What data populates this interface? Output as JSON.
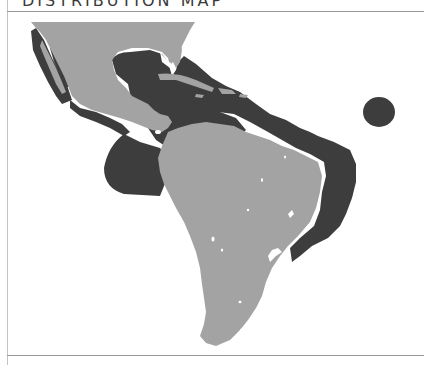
{
  "header": {
    "title": "DISTRIBUTION MAP"
  },
  "map": {
    "region": "Americas (Gulf of Mexico, Caribbean, South America)",
    "legend": [],
    "colors": {
      "land": "#a3a3a3",
      "range": "#3d3d3d",
      "water": "#ffffff",
      "frame": "#9a9a9a"
    },
    "layers": [
      {
        "name": "land",
        "description": "North/Central America and South America landmass"
      },
      {
        "name": "distribution-range",
        "description": "Species range along Pacific coast of Mexico/Central America, Gulf of Mexico, Caribbean, and Atlantic coast of South America"
      },
      {
        "name": "island-range",
        "description": "Isolated oceanic island range in the Atlantic"
      }
    ]
  }
}
